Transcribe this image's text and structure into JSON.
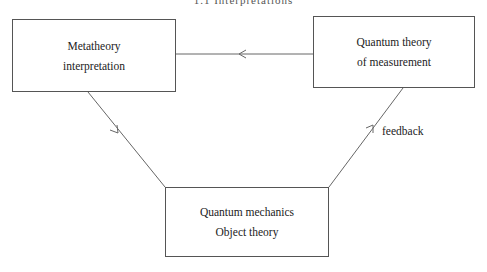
{
  "header": {
    "text": "1.1 Interpretations"
  },
  "diagram": {
    "nodes": [
      {
        "id": "metatheory",
        "lines": [
          "Metatheory",
          "interpretation"
        ]
      },
      {
        "id": "measurement",
        "lines": [
          "Quantum theory",
          "of measurement"
        ]
      },
      {
        "id": "object",
        "lines": [
          "Quantum mechanics",
          "Object theory"
        ]
      }
    ],
    "edges": [
      {
        "from": "measurement",
        "to": "metatheory",
        "label": ""
      },
      {
        "from": "metatheory",
        "to": "object",
        "label": ""
      },
      {
        "from": "object",
        "to": "measurement",
        "label": "feedback"
      }
    ],
    "colors": {
      "line": "#666666",
      "text": "#222222"
    }
  }
}
